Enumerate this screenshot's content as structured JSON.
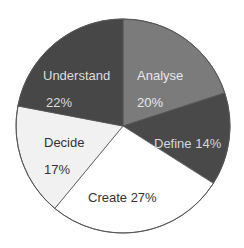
{
  "chart_data": {
    "type": "pie",
    "title": "",
    "start_angle_deg": 0,
    "direction": "clockwise",
    "slices": [
      {
        "label": "Analyse",
        "value": 20,
        "pct_text": "20%",
        "color": "#7b7b7b",
        "text_color": "#e8e8e8"
      },
      {
        "label": "Define",
        "value": 14,
        "pct_text": "14%",
        "color": "#494949",
        "text_color": "#d8d8d8"
      },
      {
        "label": "Create",
        "value": 27,
        "pct_text": "27%",
        "color": "#ffffff",
        "text_color": "#333333"
      },
      {
        "label": "Decide",
        "value": 17,
        "pct_text": "17%",
        "color": "#f1f1f1",
        "text_color": "#333333"
      },
      {
        "label": "Understand",
        "value": 22,
        "pct_text": "22%",
        "color": "#474747",
        "text_color": "#dddddd"
      }
    ],
    "legend": "none",
    "outline_color": "#555555"
  },
  "labels": {
    "analyse_name": "Analyse",
    "analyse_pct": "20%",
    "define": "Define 14%",
    "create": "Create 27%",
    "decide_name": "Decide",
    "decide_pct": "17%",
    "understand_name": "Understand",
    "understand_pct": "22%"
  }
}
